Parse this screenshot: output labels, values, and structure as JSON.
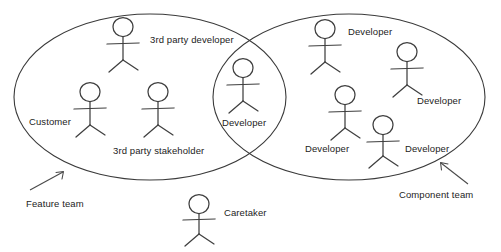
{
  "diagram": {
    "type": "venn-two-circle-actor-diagram",
    "background_color": "#ffffff",
    "stroke_color": "#3a3a3a",
    "text_color": "#232323",
    "groups": [
      {
        "id": "feature-team",
        "label": "Feature team",
        "label_x": 26,
        "label_y": 199,
        "ellipse": {
          "cx": 150,
          "cy": 97,
          "rx": 136,
          "ry": 83
        },
        "arrow": {
          "x1": 30,
          "y1": 190,
          "x2": 63,
          "y2": 172
        }
      },
      {
        "id": "component-team",
        "label": "Component team",
        "label_x": 399,
        "label_y": 190,
        "ellipse": {
          "cx": 349,
          "cy": 97,
          "rx": 136,
          "ry": 83
        },
        "arrow": {
          "x1": 468,
          "y1": 184,
          "x2": 441,
          "y2": 163
        }
      }
    ],
    "actors": [
      {
        "id": "actor-3rd-party-developer",
        "name": "3rd party developer",
        "region": "feature-team",
        "figure_x": 123,
        "figure_y": 27,
        "label_x": 150,
        "label_y": 35
      },
      {
        "id": "actor-customer",
        "name": "Customer",
        "region": "feature-team",
        "figure_x": 90,
        "figure_y": 92,
        "label_x": 29,
        "label_y": 117
      },
      {
        "id": "actor-3rd-party-stakeholder",
        "name": "3rd party stakeholder",
        "region": "feature-team",
        "figure_x": 158,
        "figure_y": 92,
        "label_x": 113,
        "label_y": 146
      },
      {
        "id": "actor-developer-shared",
        "name": "Developer",
        "region": "overlap",
        "figure_x": 243,
        "figure_y": 68,
        "label_x": 222,
        "label_y": 118
      },
      {
        "id": "actor-developer-top",
        "name": "Developer",
        "region": "component-team",
        "figure_x": 325,
        "figure_y": 29,
        "label_x": 348,
        "label_y": 27
      },
      {
        "id": "actor-developer-right",
        "name": "Developer",
        "region": "component-team",
        "figure_x": 407,
        "figure_y": 52,
        "label_x": 417,
        "label_y": 96
      },
      {
        "id": "actor-developer-mid",
        "name": "Developer",
        "region": "component-team",
        "figure_x": 345,
        "figure_y": 95,
        "label_x": 305,
        "label_y": 144
      },
      {
        "id": "actor-developer-lower",
        "name": "Developer",
        "region": "component-team",
        "figure_x": 383,
        "figure_y": 125,
        "label_x": 405,
        "label_y": 144
      },
      {
        "id": "actor-caretaker",
        "name": "Caretaker",
        "region": "outside",
        "figure_x": 199,
        "figure_y": 195,
        "label_x": 224,
        "label_y": 208
      }
    ]
  }
}
